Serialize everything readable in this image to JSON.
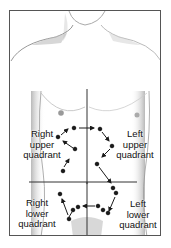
{
  "diagram": {
    "quadrants": [
      {
        "id": "ruq",
        "line1": "Right",
        "line2": "upper",
        "line3": "quadrant"
      },
      {
        "id": "luq",
        "line1": "Left",
        "line2": "upper",
        "line3": "quadrant"
      },
      {
        "id": "rlq",
        "line1": "Right",
        "line2": "lower",
        "line3": "quadrant"
      },
      {
        "id": "llq",
        "line1": "Left",
        "line2": "lower",
        "line3": "quadrant"
      }
    ],
    "colors": {
      "line": "#333333",
      "dot": "#1a1a1a",
      "skin_shade": "#bdbdbd",
      "frame": "#555555"
    }
  }
}
